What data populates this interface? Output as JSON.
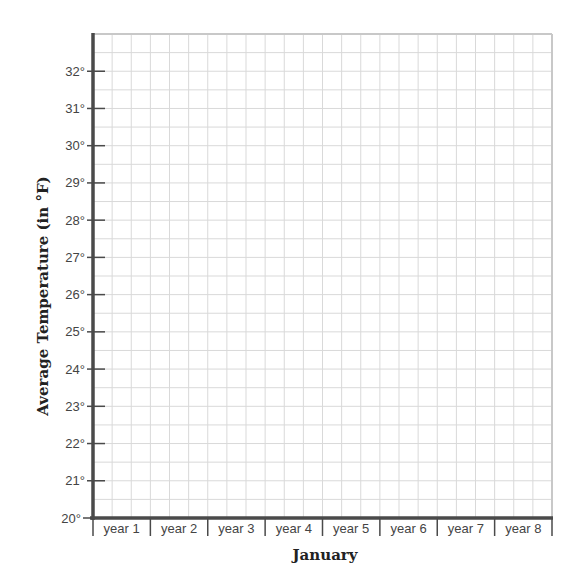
{
  "chart_data": {
    "type": "line",
    "title": "",
    "xlabel": "January",
    "ylabel": "Average Temperature (in °F)",
    "categories": [
      "year 1",
      "year 2",
      "year 3",
      "year 4",
      "year 5",
      "year 6",
      "year 7",
      "year 8"
    ],
    "y_ticks": [
      20,
      21,
      22,
      23,
      24,
      25,
      26,
      27,
      28,
      29,
      30,
      31,
      32
    ],
    "y_tick_labels": [
      "20°",
      "21°",
      "22°",
      "23°",
      "24°",
      "25°",
      "26°",
      "27°",
      "28°",
      "29°",
      "30°",
      "31°",
      "32°"
    ],
    "ylim": [
      20,
      33
    ],
    "series": [],
    "grid": true,
    "minor_grid_per_y_unit": 2,
    "minor_grid_per_category": 3,
    "colors": {
      "axis": "#4a4a4a",
      "grid": "#d9d9d9",
      "text": "#444444"
    }
  }
}
